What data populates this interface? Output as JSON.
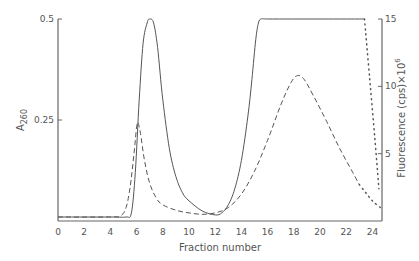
{
  "chart_data": {
    "type": "line",
    "title": "",
    "xlabel": "Fraction number",
    "ylabel_left": "A260",
    "ylabel_left_main": "A",
    "ylabel_left_sub": "260",
    "ylabel_right": "Fluorescence (cps)×10^6",
    "ylabel_right_main": "Fluorescence (cps)×10",
    "ylabel_right_sup": "6",
    "xlim": [
      0,
      25
    ],
    "ylim_left": [
      0,
      0.5
    ],
    "ylim_right": [
      0,
      15
    ],
    "x_ticks": [
      0,
      2,
      4,
      6,
      8,
      10,
      12,
      14,
      16,
      18,
      20,
      22,
      24
    ],
    "x_tick_labels": [
      "0",
      "2",
      "4",
      "6",
      "8",
      "10",
      "12",
      "14",
      "16",
      "18",
      "20",
      "22",
      "24"
    ],
    "y_left_ticks": [
      0.25,
      0.5
    ],
    "y_left_tick_labels": [
      "0.25",
      "0.5"
    ],
    "y_right_ticks": [
      5,
      10,
      15
    ],
    "y_right_tick_labels": [
      "5",
      "10",
      "15"
    ],
    "grid": false,
    "legend": null,
    "series": [
      {
        "name": "A260 (solid)",
        "axis": "left",
        "style": "solid",
        "x": [
          0,
          4,
          5.2,
          5.6,
          5.9,
          6.2,
          6.5,
          6.8,
          7.0,
          7.3,
          7.6,
          8.0,
          8.5,
          9.0,
          9.5,
          10,
          11,
          12,
          12.5,
          13,
          13.5,
          14,
          14.5,
          14.8,
          15.1,
          15.3,
          15.5,
          16,
          18,
          20,
          22,
          23.4
        ],
        "values": [
          0.01,
          0.01,
          0.01,
          0.02,
          0.12,
          0.3,
          0.44,
          0.49,
          0.5,
          0.49,
          0.43,
          0.3,
          0.18,
          0.11,
          0.07,
          0.05,
          0.025,
          0.015,
          0.02,
          0.04,
          0.08,
          0.15,
          0.26,
          0.35,
          0.45,
          0.49,
          0.5,
          0.5,
          0.5,
          0.5,
          0.5,
          0.5
        ]
      },
      {
        "name": "A260 (solid, dotted continuation)",
        "axis": "left",
        "style": "dotted",
        "x": [
          23.4,
          23.8,
          24.2,
          24.5
        ],
        "values": [
          0.5,
          0.35,
          0.2,
          0.08
        ]
      },
      {
        "name": "Fluorescence (dashed)",
        "axis": "right",
        "style": "dashed",
        "x": [
          0,
          4,
          4.8,
          5.2,
          5.5,
          5.8,
          6.0,
          6.1,
          6.3,
          6.6,
          7.0,
          7.5,
          8.0,
          9.0,
          10,
          11,
          12,
          13,
          14,
          15,
          16,
          17,
          17.8,
          18.3,
          18.8,
          19.5,
          20.5,
          21.5,
          22.5,
          23.0
        ],
        "values": [
          0.3,
          0.3,
          0.4,
          1.0,
          2.5,
          5.0,
          7.0,
          7.3,
          6.5,
          4.5,
          2.8,
          1.7,
          1.2,
          0.8,
          0.6,
          0.5,
          0.6,
          1.0,
          2.0,
          3.7,
          6.0,
          8.6,
          10.3,
          10.8,
          10.5,
          9.3,
          7.4,
          5.4,
          3.6,
          2.7
        ]
      },
      {
        "name": "Fluorescence (dashed, dotted continuation)",
        "axis": "right",
        "style": "dotted",
        "x": [
          23.0,
          23.5,
          24.0,
          24.6
        ],
        "values": [
          2.7,
          2.1,
          1.5,
          1.0
        ]
      }
    ]
  },
  "colors": {
    "line": "#555555",
    "axis": "#666666",
    "text": "#555555",
    "background": "#ffffff"
  }
}
